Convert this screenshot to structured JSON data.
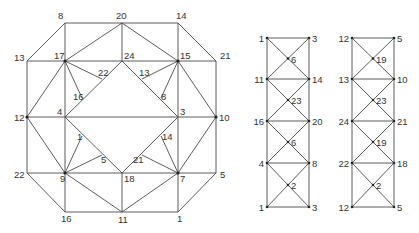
{
  "diagram": {
    "octagon": {
      "nodes": [
        {
          "id": "8",
          "x": 65,
          "y": 23,
          "lx": 58,
          "ly": 19,
          "dot": false
        },
        {
          "id": "20",
          "x": 122,
          "y": 23,
          "lx": 116,
          "ly": 19,
          "dot": false
        },
        {
          "id": "14",
          "x": 178,
          "y": 23,
          "lx": 176,
          "ly": 19,
          "dot": false
        },
        {
          "id": "13",
          "x": 27,
          "y": 61,
          "lx": 14,
          "ly": 61,
          "dot": false
        },
        {
          "id": "17",
          "x": 65,
          "y": 61,
          "lx": 54,
          "ly": 59,
          "dot": true
        },
        {
          "id": "24",
          "x": 122,
          "y": 61,
          "lx": 124,
          "ly": 59,
          "dot": false
        },
        {
          "id": "15",
          "x": 178,
          "y": 61,
          "lx": 180,
          "ly": 59,
          "dot": true
        },
        {
          "id": "21",
          "x": 216,
          "y": 61,
          "lx": 220,
          "ly": 59,
          "dot": false
        },
        {
          "id": "12",
          "x": 27,
          "y": 117,
          "lx": 14,
          "ly": 121,
          "dot": true
        },
        {
          "id": "4",
          "x": 65,
          "y": 117,
          "lx": 57,
          "ly": 115,
          "dot": false
        },
        {
          "id": "3",
          "x": 178,
          "y": 117,
          "lx": 180,
          "ly": 115,
          "dot": false
        },
        {
          "id": "10",
          "x": 216,
          "y": 117,
          "lx": 219,
          "ly": 121,
          "dot": true
        },
        {
          "id": "22",
          "x": 27,
          "y": 173,
          "lx": 14,
          "ly": 178,
          "dot": false
        },
        {
          "id": "9",
          "x": 65,
          "y": 173,
          "lx": 60,
          "ly": 182,
          "dot": true
        },
        {
          "id": "18",
          "x": 122,
          "y": 173,
          "lx": 124,
          "ly": 182,
          "dot": false
        },
        {
          "id": "7",
          "x": 178,
          "y": 173,
          "lx": 180,
          "ly": 182,
          "dot": true
        },
        {
          "id": "5",
          "x": 216,
          "y": 173,
          "lx": 220,
          "ly": 178,
          "dot": false
        },
        {
          "id": "16",
          "x": 65,
          "y": 212,
          "lx": 61,
          "ly": 222,
          "dot": false
        },
        {
          "id": "11",
          "x": 122,
          "y": 212,
          "lx": 118,
          "ly": 223,
          "dot": false
        },
        {
          "id": "1",
          "x": 178,
          "y": 212,
          "lx": 177,
          "ly": 222,
          "dot": false
        },
        {
          "id": "22i",
          "label": "22",
          "x": 102,
          "y": 79,
          "lx": 98,
          "ly": 76,
          "dot": false
        },
        {
          "id": "16i",
          "label": "16",
          "x": 82,
          "y": 98,
          "lx": 73,
          "ly": 100,
          "dot": false
        },
        {
          "id": "13i",
          "label": "13",
          "x": 142,
          "y": 79,
          "lx": 139,
          "ly": 76,
          "dot": false
        },
        {
          "id": "8i",
          "label": "8",
          "x": 161,
          "y": 98,
          "lx": 161,
          "ly": 100,
          "dot": false
        },
        {
          "id": "1i",
          "label": "1",
          "x": 82,
          "y": 136,
          "lx": 77,
          "ly": 140,
          "dot": false
        },
        {
          "id": "5i",
          "label": "5",
          "x": 102,
          "y": 155,
          "lx": 101,
          "ly": 163,
          "dot": false
        },
        {
          "id": "14i",
          "label": "14",
          "x": 161,
          "y": 136,
          "lx": 162,
          "ly": 140,
          "dot": false
        },
        {
          "id": "21i",
          "label": "21",
          "x": 142,
          "y": 155,
          "lx": 133,
          "ly": 163,
          "dot": false
        }
      ],
      "edges": [
        [
          "13",
          "8"
        ],
        [
          "8",
          "14"
        ],
        [
          "14",
          "21"
        ],
        [
          "21",
          "10"
        ],
        [
          "10",
          "5"
        ],
        [
          "5",
          "1"
        ],
        [
          "1",
          "16"
        ],
        [
          "16",
          "22"
        ],
        [
          "22",
          "12"
        ],
        [
          "12",
          "13"
        ],
        [
          "8",
          "17"
        ],
        [
          "14",
          "15"
        ],
        [
          "20",
          "24"
        ],
        [
          "16",
          "9"
        ],
        [
          "1",
          "7"
        ],
        [
          "11",
          "18"
        ],
        [
          "13",
          "21"
        ],
        [
          "12",
          "10"
        ],
        [
          "22",
          "5"
        ],
        [
          "17",
          "4"
        ],
        [
          "4",
          "9"
        ],
        [
          "15",
          "3"
        ],
        [
          "3",
          "7"
        ],
        [
          "17",
          "20"
        ],
        [
          "20",
          "15"
        ],
        [
          "9",
          "11"
        ],
        [
          "11",
          "7"
        ],
        [
          "17",
          "12"
        ],
        [
          "12",
          "9"
        ],
        [
          "15",
          "10"
        ],
        [
          "10",
          "7"
        ],
        [
          "24",
          "4"
        ],
        [
          "24",
          "3"
        ],
        [
          "4",
          "18"
        ],
        [
          "3",
          "18"
        ],
        [
          "17",
          "22i"
        ],
        [
          "17",
          "16i"
        ],
        [
          "15",
          "13i"
        ],
        [
          "15",
          "8i"
        ],
        [
          "9",
          "1i"
        ],
        [
          "9",
          "5i"
        ],
        [
          "7",
          "14i"
        ],
        [
          "7",
          "21i"
        ]
      ]
    },
    "ladders": [
      {
        "left_x": 267,
        "right_x": 309,
        "rows_y": [
          38,
          79,
          121,
          163,
          207
        ],
        "left_labels": [
          "1",
          "11",
          "16",
          "4",
          "1"
        ],
        "right_labels": [
          "3",
          "14",
          "20",
          "8",
          "3"
        ],
        "center_labels": [
          "6",
          "23",
          "6",
          "2"
        ]
      },
      {
        "left_x": 352,
        "right_x": 394,
        "rows_y": [
          38,
          79,
          121,
          163,
          207
        ],
        "left_labels": [
          "12",
          "13",
          "24",
          "22",
          "12"
        ],
        "right_labels": [
          "5",
          "10",
          "21",
          "18",
          "5"
        ],
        "center_labels": [
          "19",
          "23",
          "19",
          "2"
        ]
      }
    ]
  },
  "colors": {
    "line": "#4a4a4a",
    "text": "#333333",
    "background": "#ffffff"
  }
}
